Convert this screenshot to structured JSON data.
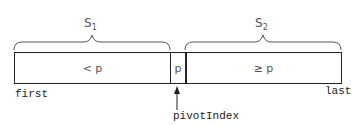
{
  "diagram": {
    "sets": [
      {
        "name": "S",
        "sub": "1"
      },
      {
        "name": "S",
        "sub": "2"
      }
    ],
    "segments": [
      {
        "label": "< p"
      },
      {
        "label": "p"
      },
      {
        "label": "≥ p"
      }
    ],
    "markers": {
      "first": "first",
      "last": "last",
      "pivot": "pivotIndex"
    },
    "colors": {
      "line": "#222222",
      "brace": "#555555",
      "text": "#555555"
    }
  }
}
